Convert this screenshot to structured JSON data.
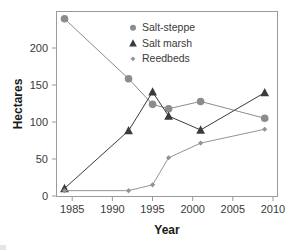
{
  "chart_data": {
    "type": "line",
    "title": "",
    "xlabel": "Year",
    "ylabel": "Hectares",
    "xlim": [
      1983.0,
      2010.6
    ],
    "ylim": [
      -8,
      245
    ],
    "xticks": [
      1985,
      1990,
      1995,
      2000,
      2005,
      2010
    ],
    "yticks": [
      0,
      50,
      100,
      150,
      200
    ],
    "grid": false,
    "legend_position": "top-center",
    "x": [
      1984,
      1992,
      1995,
      1997,
      2001,
      2009
    ],
    "series": [
      {
        "name": "Salt-steppe",
        "marker": "circle",
        "color": "#8c8c8c",
        "values": [
          235,
          153,
          118,
          112,
          122,
          99
        ]
      },
      {
        "name": "Salt marsh",
        "marker": "triangle",
        "color": "#3b3b3b",
        "values": [
          3,
          82,
          135,
          102,
          83,
          134
        ]
      },
      {
        "name": "Reedbeds",
        "marker": "diamond",
        "color": "#949494",
        "values": [
          0,
          0,
          8,
          45,
          65,
          84
        ]
      }
    ]
  },
  "axis": {
    "xlabel": "Year",
    "ylabel": "Hectares",
    "xtick_labels": [
      "1985",
      "1990",
      "1995",
      "2000",
      "2005",
      "2010"
    ],
    "ytick_labels": [
      "0",
      "50",
      "100",
      "150",
      "200"
    ]
  },
  "legend": {
    "entries": [
      {
        "label": "Salt-steppe",
        "marker": "circle-marker-icon"
      },
      {
        "label": "Salt marsh",
        "marker": "triangle-marker-icon"
      },
      {
        "label": "Reedbeds",
        "marker": "diamond-marker-icon"
      }
    ]
  },
  "colors": {
    "salt_steppe": "#8c8c8c",
    "salt_marsh": "#3b3b3b",
    "reedbeds": "#949494",
    "frame": "#9a9a9a",
    "text": "#3a3a3a",
    "background": "#ffffff"
  }
}
